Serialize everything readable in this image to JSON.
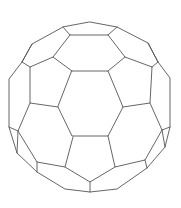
{
  "figure": {
    "background": "#ffffff",
    "stroke_color": "#555555",
    "width": 181,
    "height": 208,
    "faces": {
      "center_hexagon": [
        [
          72,
          71
        ],
        [
          108,
          71
        ],
        [
          123,
          107
        ],
        [
          108,
          136
        ],
        [
          72,
          136
        ],
        [
          58,
          107
        ]
      ],
      "top_hexagon": [
        [
          64,
          26
        ],
        [
          90,
          22
        ],
        [
          117,
          27
        ],
        [
          108,
          35
        ],
        [
          72,
          35
        ],
        [
          69,
          35
        ]
      ],
      "top_band": [
        [
          70,
          35
        ],
        [
          108,
          35
        ],
        [
          125,
          57
        ],
        [
          108,
          71
        ],
        [
          72,
          71
        ],
        [
          53,
          57
        ]
      ],
      "upper_left_pentagon": [
        [
          53,
          57
        ],
        [
          72,
          71
        ],
        [
          58,
          107
        ],
        [
          30,
          103
        ],
        [
          30,
          67
        ]
      ],
      "upper_right_pentagon": [
        [
          125,
          57
        ],
        [
          152,
          67
        ],
        [
          150,
          103
        ],
        [
          123,
          107
        ],
        [
          108,
          71
        ]
      ],
      "lower_left_hexagon": [
        [
          30,
          103
        ],
        [
          58,
          107
        ],
        [
          73,
          137
        ],
        [
          65,
          167
        ],
        [
          37,
          162
        ],
        [
          18,
          131
        ]
      ],
      "lower_right_hexagon": [
        [
          150,
          103
        ],
        [
          162,
          130
        ],
        [
          145,
          160
        ],
        [
          115,
          167
        ],
        [
          108,
          136
        ],
        [
          123,
          107
        ]
      ],
      "bottom_pentagon": [
        [
          72,
          136
        ],
        [
          108,
          136
        ],
        [
          115,
          166
        ],
        [
          90,
          182
        ],
        [
          65,
          166
        ]
      ]
    },
    "outline": [
      [
        90,
        22
      ],
      [
        117,
        27
      ],
      [
        148,
        43
      ],
      [
        170,
        78
      ],
      [
        170,
        127
      ],
      [
        165,
        147
      ],
      [
        147,
        168
      ],
      [
        117,
        189
      ],
      [
        90,
        192
      ],
      [
        65,
        189
      ],
      [
        37,
        172
      ],
      [
        17,
        153
      ],
      [
        9,
        127
      ],
      [
        9,
        79
      ],
      [
        22,
        62
      ],
      [
        32,
        44
      ],
      [
        63,
        27
      ]
    ]
  }
}
